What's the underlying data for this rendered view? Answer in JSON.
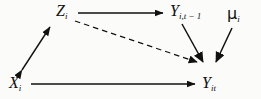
{
  "figure": {
    "kind": "causal-path-diagram",
    "background_color": "#fbfbfa",
    "stroke_color": "#111111",
    "width": 261,
    "height": 99
  },
  "nodes": [
    {
      "id": "z",
      "name": "node-z",
      "base": "Z",
      "subscript": "i",
      "plain": "Z_i",
      "x": 56,
      "y": 3
    },
    {
      "id": "y_lag",
      "name": "node-y-lagged",
      "base": "Y",
      "subscript": "i,t − 1",
      "plain": "Y_{i,t-1}",
      "x": 170,
      "y": 3
    },
    {
      "id": "mu",
      "name": "node-mu",
      "base": "μ",
      "subscript": "i",
      "plain": "mu_i",
      "x": 227,
      "y": 6
    },
    {
      "id": "x",
      "name": "node-x",
      "base": "X",
      "subscript": "i",
      "plain": "X_i",
      "x": 9,
      "y": 75
    },
    {
      "id": "y_it",
      "name": "node-y-it",
      "base": "Y",
      "subscript": "it",
      "plain": "Y_it",
      "x": 202,
      "y": 75
    }
  ],
  "edges": [
    {
      "id": "z-to-ylag",
      "name": "edge-z-to-y-lagged",
      "from": "z",
      "to": "y_lag",
      "style": "solid",
      "arrow": "single",
      "x1": 78,
      "y1": 13,
      "x2": 166,
      "y2": 13
    },
    {
      "id": "z-to-yit",
      "name": "edge-z-to-y-it-dashed",
      "from": "z",
      "to": "y_it",
      "style": "dashed",
      "arrow": "single",
      "x1": 74,
      "y1": 21,
      "x2": 201,
      "y2": 65
    },
    {
      "id": "ylag-to-yit",
      "name": "edge-y-lagged-to-y-it",
      "from": "y_lag",
      "to": "y_it",
      "style": "solid",
      "arrow": "single",
      "x1": 183,
      "y1": 24,
      "x2": 206,
      "y2": 65
    },
    {
      "id": "mu-to-yit",
      "name": "edge-mu-to-y-it",
      "from": "mu",
      "to": "y_it",
      "style": "solid",
      "arrow": "single",
      "x1": 231,
      "y1": 27,
      "x2": 214,
      "y2": 65
    },
    {
      "id": "x-to-yit",
      "name": "edge-x-to-y-it",
      "from": "x",
      "to": "y_it",
      "style": "solid",
      "arrow": "single",
      "x1": 31,
      "y1": 84,
      "x2": 198,
      "y2": 84
    },
    {
      "id": "x-z-correlation",
      "name": "edge-x-z-correlation",
      "from": "x",
      "to": "z",
      "style": "solid",
      "arrow": "double",
      "x1": 22,
      "y1": 71,
      "x2": 50,
      "y2": 26
    }
  ]
}
